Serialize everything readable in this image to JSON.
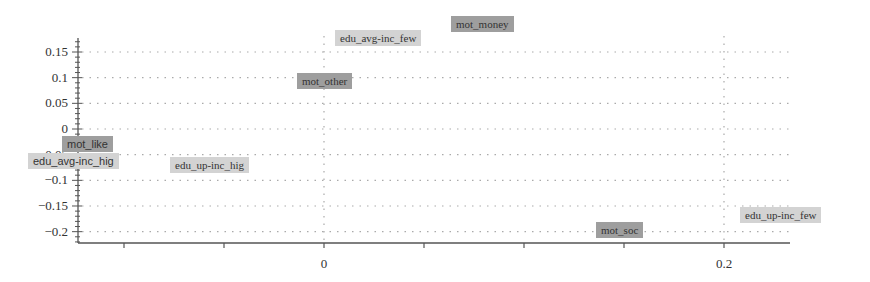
{
  "chart_data": {
    "type": "scatter",
    "title": "",
    "xlabel": "",
    "ylabel": "",
    "xlim": [
      -0.12,
      0.23
    ],
    "ylim": [
      -0.225,
      0.18
    ],
    "grid": true,
    "x_ticks": [
      {
        "value": 0,
        "label": "0"
      },
      {
        "value": 0.2,
        "label": "0.2"
      }
    ],
    "y_ticks": [
      {
        "value": 0.15,
        "label": "0.15"
      },
      {
        "value": 0.1,
        "label": "0.1"
      },
      {
        "value": 0.05,
        "label": "0.05"
      },
      {
        "value": 0,
        "label": "0"
      },
      {
        "value": -0.05,
        "label": "-0.05"
      },
      {
        "value": -0.1,
        "label": "-0.1"
      },
      {
        "value": -0.15,
        "label": "-0.15"
      },
      {
        "value": -0.2,
        "label": "-0.2"
      }
    ],
    "series": [
      {
        "name": "motivation",
        "style": "dark",
        "points": [
          {
            "label": "mot_money",
            "x": 0.085,
            "y": 0.2
          },
          {
            "label": "mot_other",
            "x": -0.01,
            "y": 0.095
          },
          {
            "label": "mot_like",
            "x": -0.115,
            "y": -0.028
          },
          {
            "label": "mot_soc",
            "x": 0.15,
            "y": -0.2
          }
        ]
      },
      {
        "name": "education-income",
        "style": "light",
        "points": [
          {
            "label": "edu_avg-inc_few",
            "x": 0.025,
            "y": 0.183
          },
          {
            "label": "edu_avg-inc_hig",
            "x": -0.12,
            "y": -0.065
          },
          {
            "label": "edu_up-inc_hig",
            "x": -0.055,
            "y": -0.067
          },
          {
            "label": "edu_up-inc_few",
            "x": 0.245,
            "y": -0.17
          }
        ]
      }
    ]
  }
}
